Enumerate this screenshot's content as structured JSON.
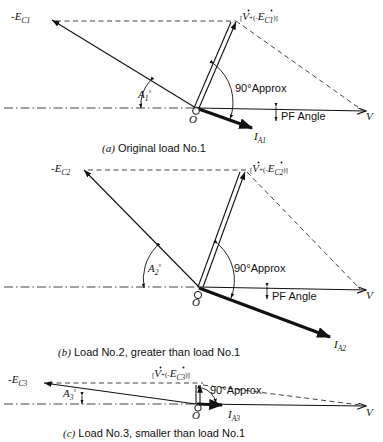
{
  "figure": {
    "type": "vector-phasor-diagram",
    "stroke_color": "#111111",
    "background_color": "#ffffff"
  },
  "panels": [
    {
      "id": "panel-a",
      "caption_tag": "(a)",
      "caption_text": "Original load No.1",
      "labels": {
        "ec": "-E",
        "ec_sub": "C1",
        "resultant_open": "[",
        "resultant_v": "V",
        "resultant_mid": "+(-",
        "resultant_e": "E",
        "resultant_e_sub": "C1",
        "resultant_close": ")]",
        "angle": "A",
        "angle_sub": "1",
        "angle_sup": "°",
        "right_angle": "90°Approx",
        "pf_angle": "PF Angle",
        "origin": "O",
        "voltage": "V",
        "current": "I",
        "current_sub": "A1"
      }
    },
    {
      "id": "panel-b",
      "caption_tag": "(b)",
      "caption_text": "Load No.2, greater than load No.1",
      "labels": {
        "ec": "-E",
        "ec_sub": "C2",
        "resultant_open": "[",
        "resultant_v": "V",
        "resultant_mid": "+(-",
        "resultant_e": "E",
        "resultant_e_sub": "C2",
        "resultant_close": ")]",
        "angle": "A",
        "angle_sub": "2",
        "angle_sup": "°",
        "right_angle": "90°Approx",
        "pf_angle": "PF Angle",
        "origin": "O",
        "voltage": "V",
        "current": "I",
        "current_sub": "A2"
      }
    },
    {
      "id": "panel-c",
      "caption_tag": "(c)",
      "caption_text": "Load No.3, smaller than load No.1",
      "labels": {
        "ec": "-E",
        "ec_sub": "C3",
        "resultant_open": "[",
        "resultant_v": "V",
        "resultant_mid": "+(-",
        "resultant_e": "E",
        "resultant_e_sub": "C3",
        "resultant_close": ")]",
        "angle": "A",
        "angle_sub": "3",
        "angle_sup": "°",
        "right_angle": "90°Approx",
        "origin": "O",
        "voltage": "V",
        "current": "I",
        "current_sub": "A3"
      }
    }
  ]
}
